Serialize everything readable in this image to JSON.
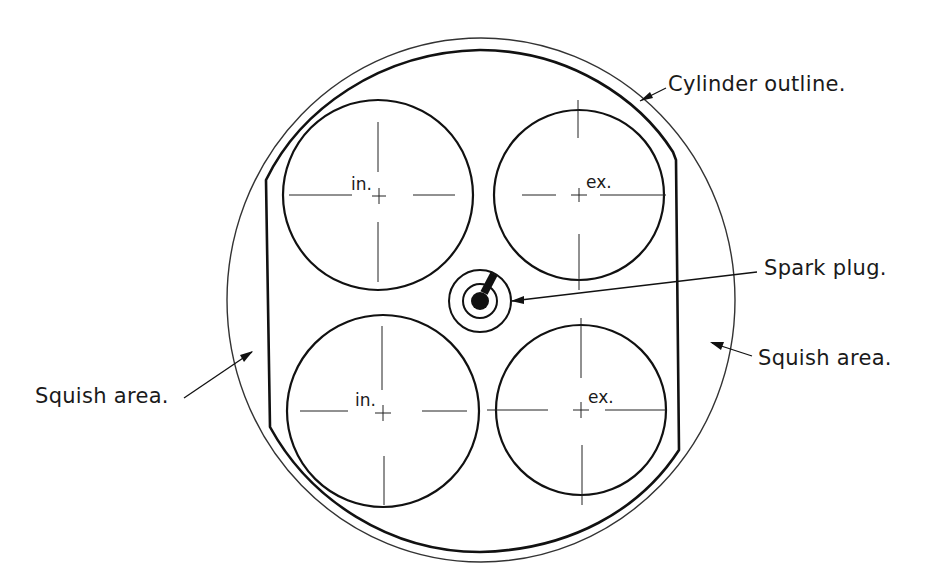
{
  "diagram": {
    "labels": {
      "cylinder_outline": "Cylinder outline.",
      "spark_plug": "Spark plug.",
      "squish_area_right": "Squish area.",
      "squish_area_left": "Squish area."
    },
    "valves": [
      {
        "id": "intake-upper",
        "label": "in.",
        "cx": 378,
        "cy": 195,
        "r": 95
      },
      {
        "id": "exhaust-upper",
        "label": "ex.",
        "cx": 579,
        "cy": 195,
        "r": 85
      },
      {
        "id": "intake-lower",
        "label": "in.",
        "cx": 383,
        "cy": 411,
        "r": 96
      },
      {
        "id": "exhaust-lower",
        "label": "ex.",
        "cx": 581,
        "cy": 410,
        "r": 85
      }
    ],
    "colors": {
      "line": "#1a1a1a",
      "background": "#ffffff"
    }
  }
}
